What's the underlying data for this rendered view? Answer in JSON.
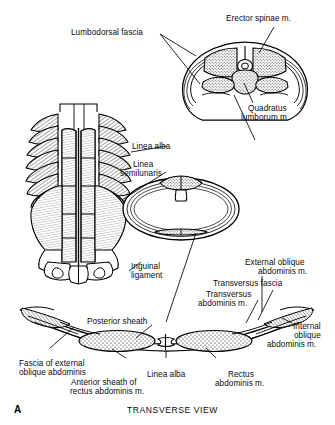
{
  "figure": {
    "panel_letter": "A",
    "caption": "TRANSVERSE VIEW",
    "background_color": "#ffffff",
    "ink_color": "#000000"
  },
  "labels": {
    "lumbodorsal_fascia": "Lumbodorsal fascia",
    "erector_spinae": "Erector spinae m.",
    "quadratus_lumborum_line1": "Quadratus",
    "quadratus_lumborum_line2": "lumborum m.",
    "linea_alba_upper": "Linea alba",
    "linea_semilunaris_line1": "Linea",
    "linea_semilunaris_line2": "semilunaris",
    "inguinal_ligament_line1": "Inguinal",
    "inguinal_ligament_line2": "ligament",
    "external_oblique_line1": "External oblique",
    "external_oblique_line2": "abdominis m.",
    "transversus_fascia": "Transversus fascia",
    "transversus_abdominis_line1": "Transversus",
    "transversus_abdominis_line2": "abdominis m.",
    "internal_oblique_line1": "Internal",
    "internal_oblique_line2": "oblique",
    "internal_oblique_line3": "abdominis m.",
    "posterior_sheath": "Posterior sheath",
    "fascia_external_oblique_line1": "Fascia of external",
    "fascia_external_oblique_line2": "oblique abdominis",
    "anterior_sheath_line1": "Anterior sheath of",
    "anterior_sheath_line2": "rectus abdominis m.",
    "linea_alba_lower": "Linea alba",
    "rectus_abdominis_line1": "Rectus",
    "rectus_abdominis_line2": "abdominis m."
  }
}
